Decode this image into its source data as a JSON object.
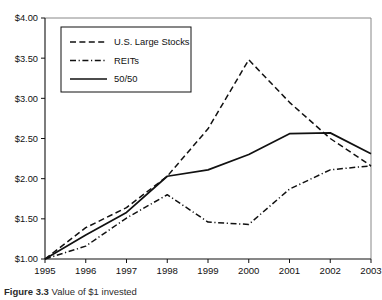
{
  "figure": {
    "caption_label": "Figure 3.3",
    "caption_rest": " Value of $1 invested"
  },
  "chart_data": {
    "type": "line",
    "title": "",
    "xlabel": "",
    "ylabel": "",
    "x": [
      1995,
      1996,
      1997,
      1998,
      1999,
      2000,
      2001,
      2002,
      2003
    ],
    "categories": [
      "1995",
      "1996",
      "1997",
      "1998",
      "1999",
      "2000",
      "2001",
      "2002",
      "2003"
    ],
    "series": [
      {
        "name": "U.S. Large Stocks",
        "style": "dashed",
        "values": [
          1.0,
          1.39,
          1.64,
          2.03,
          2.62,
          3.48,
          2.95,
          2.5,
          2.16
        ]
      },
      {
        "name": "REITs",
        "style": "dash-dot",
        "values": [
          1.0,
          1.16,
          1.51,
          1.8,
          1.46,
          1.43,
          1.87,
          2.11,
          2.16
        ]
      },
      {
        "name": "50/50",
        "style": "solid",
        "values": [
          1.0,
          1.3,
          1.58,
          2.03,
          2.11,
          2.3,
          2.56,
          2.57,
          2.31
        ]
      }
    ],
    "ylim": [
      1.0,
      4.0
    ],
    "xlim": [
      1995,
      2003
    ],
    "ytick_values": [
      1.0,
      1.5,
      2.0,
      2.5,
      3.0,
      3.5,
      4.0
    ],
    "ytick_labels": [
      "$1.00",
      "$1.50",
      "$2.00",
      "$2.50",
      "$3.00",
      "$3.50",
      "$4.00"
    ],
    "xtick_labels": [
      "1995",
      "1996",
      "1997",
      "1998",
      "1999",
      "2000",
      "2001",
      "2002",
      "2003"
    ],
    "grid": false,
    "legend_position": "upper-left",
    "legend_entries": [
      "U.S. Large Stocks",
      "REITs",
      "50/50"
    ],
    "line_color": "#111111",
    "background_color": "#ffffff"
  }
}
